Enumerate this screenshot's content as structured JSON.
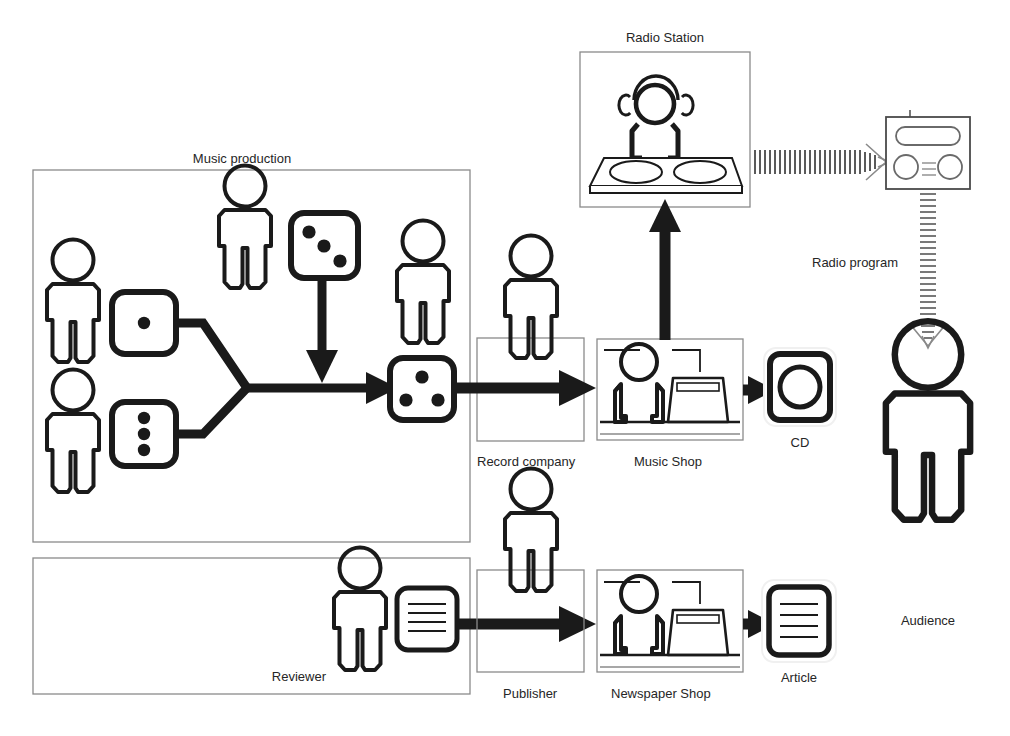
{
  "diagram": {
    "background_color": "#ffffff",
    "ink_color": "#1a1a1a",
    "thin_border_color": "#808080"
  },
  "groups": [
    {
      "id": "music-production",
      "label": "Music production",
      "label_position": "top-center"
    },
    {
      "id": "reviewing",
      "label": "",
      "label_position": "none"
    }
  ],
  "labels": {
    "music_production": "Music production",
    "radio_station": "Radio Station",
    "radio_program": "Radio program",
    "record_company": "Record company",
    "music_shop": "Music Shop",
    "cd": "CD",
    "reviewer": "Reviewer",
    "publisher": "Publisher",
    "newspaper_shop": "Newspaper Shop",
    "article": "Article",
    "audience": "Audience"
  },
  "dice": [
    {
      "id": "die-one-dot",
      "name": "composer-die",
      "pips": 1,
      "pattern": "center"
    },
    {
      "id": "die-three-vertical",
      "name": "lyricist-die",
      "pips": 3,
      "pattern": "vertical-column"
    },
    {
      "id": "die-three-diagonal",
      "name": "producer-die",
      "pips": 3,
      "pattern": "diagonal"
    },
    {
      "id": "die-three-triangle",
      "name": "master-recording-die",
      "pips": 3,
      "pattern": "triangle"
    }
  ],
  "actors": [
    {
      "id": "actor-composer",
      "role": "composer",
      "label": ""
    },
    {
      "id": "actor-lyricist",
      "role": "lyricist",
      "label": ""
    },
    {
      "id": "actor-producer",
      "role": "producer",
      "label": ""
    },
    {
      "id": "actor-artist",
      "role": "artist",
      "label": ""
    },
    {
      "id": "actor-record-company",
      "role": "record company staff",
      "label": "Record company"
    },
    {
      "id": "actor-dj",
      "role": "radio dj",
      "label": "Radio Station"
    },
    {
      "id": "actor-reviewer",
      "role": "reviewer",
      "label": "Reviewer"
    },
    {
      "id": "actor-publisher",
      "role": "publisher",
      "label": "Publisher"
    },
    {
      "id": "actor-audience",
      "role": "audience",
      "label": "Audience"
    }
  ],
  "artifacts": [
    {
      "id": "artifact-cd",
      "label": "CD",
      "icon": "cd-icon"
    },
    {
      "id": "artifact-article",
      "label": "Article",
      "icon": "document-icon",
      "lines": 4
    },
    {
      "id": "artifact-review-document",
      "label": "",
      "icon": "document-icon",
      "lines": 4
    },
    {
      "id": "artifact-radio-receiver",
      "label": "",
      "icon": "radio-receiver-icon"
    }
  ],
  "flows": [
    {
      "id": "flow-merge",
      "from": "composer-die + lyricist-die",
      "to": "master-recording-die",
      "style": "solid-thick"
    },
    {
      "id": "flow-producer",
      "from": "producer-die",
      "to": "master-recording-die",
      "style": "solid-thick-down-arrow"
    },
    {
      "id": "flow-to-record-company",
      "from": "master-recording-die",
      "to": "Record company",
      "style": "solid-thick-arrow"
    },
    {
      "id": "flow-to-radio-station",
      "from": "Record company",
      "to": "Radio Station",
      "style": "solid-thick-up-arrow"
    },
    {
      "id": "flow-to-cd",
      "from": "Music Shop",
      "to": "CD",
      "style": "solid-thick-arrow"
    },
    {
      "id": "flow-broadcast",
      "from": "Radio Station",
      "to": "radio receiver",
      "style": "striped-wave-arrow"
    },
    {
      "id": "flow-radio-program",
      "from": "radio receiver",
      "to": "Audience",
      "style": "striped-down-arrow",
      "label": "Radio program"
    },
    {
      "id": "flow-review",
      "from": "Reviewer",
      "to": "Newspaper Shop",
      "style": "solid-thick-arrow"
    },
    {
      "id": "flow-to-article",
      "from": "Newspaper Shop",
      "to": "Article",
      "style": "solid-thick-arrow"
    }
  ]
}
